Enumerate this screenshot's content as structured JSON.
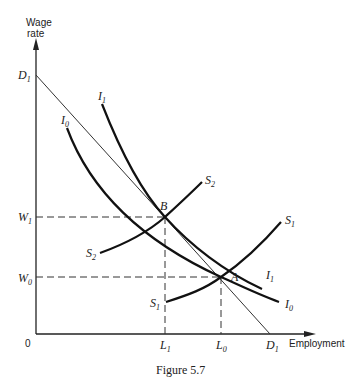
{
  "figure": {
    "caption": "Figure 5.7",
    "y_axis_label_line1": "Wage",
    "y_axis_label_line2": "rate",
    "x_axis_label": "Employment",
    "origin_label": "0"
  },
  "labels": {
    "D1_top": {
      "main": "D",
      "sub": "1"
    },
    "D1_bottom": {
      "main": "D",
      "sub": "1"
    },
    "W1": {
      "main": "W",
      "sub": "1"
    },
    "W0": {
      "main": "W",
      "sub": "0"
    },
    "L1": {
      "main": "L",
      "sub": "1"
    },
    "L0": {
      "main": "L",
      "sub": "0"
    },
    "I1_top": {
      "main": "I",
      "sub": "1"
    },
    "I1_end": {
      "main": "I",
      "sub": "1"
    },
    "I0_top": {
      "main": "I",
      "sub": "0"
    },
    "I0_end": {
      "main": "I",
      "sub": "0"
    },
    "S2_top": {
      "main": "S",
      "sub": "2"
    },
    "S2_bottom": {
      "main": "S",
      "sub": "2"
    },
    "S1_top": {
      "main": "S",
      "sub": "1"
    },
    "S1_bottom": {
      "main": "S",
      "sub": "1"
    },
    "B": "B",
    "A": "A"
  },
  "curves": [
    {
      "name": "D1",
      "type": "demand line",
      "description": "straight line from D1 on wage axis to D1 on employment axis"
    },
    {
      "name": "I1",
      "type": "indifference curve",
      "description": "higher indifference curve, passes through B"
    },
    {
      "name": "I0",
      "type": "indifference curve",
      "description": "lower indifference curve, tangent at A"
    },
    {
      "name": "S2",
      "type": "supply curve",
      "description": "upward sloping, passes through B"
    },
    {
      "name": "S1",
      "type": "supply curve",
      "description": "upward sloping, passes through A"
    }
  ],
  "points": {
    "B": {
      "wage": "W1",
      "employment": "L1"
    },
    "A": {
      "wage": "W0",
      "employment": "L0"
    }
  }
}
